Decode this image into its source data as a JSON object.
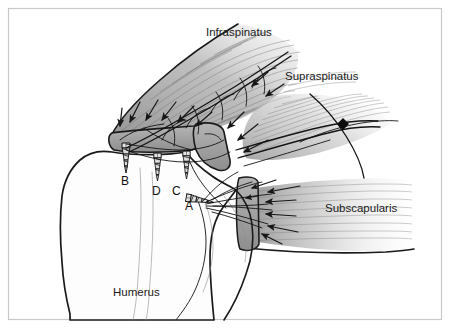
{
  "figure": {
    "frame_color": "#c9c9c9",
    "background_color": "#ffffff",
    "ink_color": "#1a1a1a",
    "muscle_fill_color": "#a9a9a9"
  },
  "labels": {
    "infraspinatus": "Infraspinatus",
    "supraspinatus": "Supraspinatus",
    "subscapularis": "Subscapularis",
    "humerus": "Humerus"
  },
  "anchors": [
    {
      "id": "A",
      "label": "A",
      "x": 190,
      "y": 206,
      "orientation": "horizontal"
    },
    {
      "id": "B",
      "label": "B",
      "x": 126,
      "y": 181,
      "orientation": "vertical"
    },
    {
      "id": "C",
      "label": "C",
      "x": 177,
      "y": 191,
      "orientation": "vertical"
    },
    {
      "id": "D",
      "label": "D",
      "x": 157,
      "y": 191,
      "orientation": "vertical"
    }
  ],
  "structures": [
    {
      "name": "infraspinatus-muscle",
      "kind": "muscle",
      "shading": "hatched-gray"
    },
    {
      "name": "supraspinatus-muscle",
      "kind": "muscle",
      "shading": "hatched-gray"
    },
    {
      "name": "subscapularis-muscle",
      "kind": "muscle",
      "shading": "hatched-gray"
    },
    {
      "name": "humerus-bone",
      "kind": "bone",
      "shading": "outline-white"
    },
    {
      "name": "greater-tuberosity",
      "kind": "bone-landmark",
      "shading": "gray-block"
    },
    {
      "name": "suture-knot",
      "kind": "suture-hardware",
      "shading": "solid-black"
    }
  ]
}
